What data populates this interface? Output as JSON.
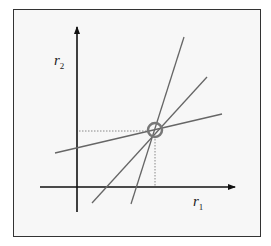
{
  "diagram": {
    "type": "line-intersection",
    "axes": {
      "x_label": "r",
      "x_subscript": "1",
      "y_label": "r",
      "y_subscript": "2"
    },
    "lines": [
      {
        "name": "steep-line",
        "x1": 131,
        "y1": 204,
        "x2": 184,
        "y2": 37
      },
      {
        "name": "medium-line",
        "x1": 92,
        "y1": 203,
        "x2": 207,
        "y2": 77
      },
      {
        "name": "shallow-line",
        "x1": 55,
        "y1": 153,
        "x2": 222,
        "y2": 114
      }
    ],
    "intersection": {
      "cx": 155,
      "cy": 130,
      "r": 7
    },
    "colors": {
      "axis": "#111111",
      "line": "#666666",
      "circle": "#777777",
      "dotted": "#888888",
      "frame": "#333333",
      "background": "#f7f7f7"
    }
  }
}
